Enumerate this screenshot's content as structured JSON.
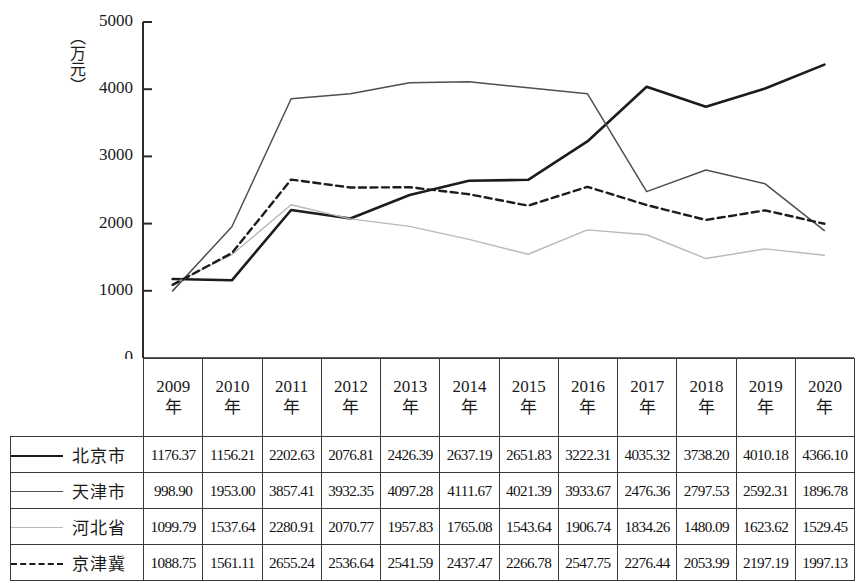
{
  "chart_data": {
    "type": "line",
    "title": "",
    "xlabel": "",
    "ylabel": "（万元）",
    "ylim": [
      0,
      5000
    ],
    "yticks": [
      0,
      1000,
      2000,
      3000,
      4000,
      5000
    ],
    "grid": false,
    "legend_position": "table-left-column",
    "categories": [
      "2009年",
      "2010年",
      "2011年",
      "2012年",
      "2013年",
      "2014年",
      "2015年",
      "2016年",
      "2017年",
      "2018年",
      "2019年",
      "2020年"
    ],
    "series": [
      {
        "name": "北京市",
        "style": "solid-thick-black",
        "color": "#1c1c1c",
        "values": [
          1176.37,
          1156.21,
          2202.63,
          2076.81,
          2426.39,
          2637.19,
          2651.83,
          3222.31,
          4035.32,
          3738.2,
          4010.18,
          4366.1
        ]
      },
      {
        "name": "天津市",
        "style": "solid-medium-gray",
        "color": "#4f4f4f",
        "values": [
          998.9,
          1953.0,
          3857.41,
          3932.35,
          4097.28,
          4111.67,
          4021.39,
          3933.67,
          2476.36,
          2797.53,
          2592.31,
          1896.78
        ]
      },
      {
        "name": "河北省",
        "style": "solid-light-gray",
        "color": "#b9b9b9",
        "values": [
          1099.79,
          1537.64,
          2280.91,
          2070.77,
          1957.83,
          1765.08,
          1543.64,
          1906.74,
          1834.26,
          1480.09,
          1623.62,
          1529.45
        ]
      },
      {
        "name": "京津冀",
        "style": "dashed-black",
        "color": "#1c1c1c",
        "values": [
          1088.75,
          1561.11,
          2655.24,
          2536.64,
          2541.59,
          2437.47,
          2266.78,
          2547.75,
          2276.44,
          2053.99,
          2197.19,
          1997.13
        ]
      }
    ]
  },
  "axis": {
    "y_title": "（万元）",
    "y_tick_labels": [
      "5000",
      "4000",
      "3000",
      "2000",
      "1000",
      "0"
    ]
  },
  "table": {
    "year_headers": [
      {
        "num": "2009",
        "char": "年"
      },
      {
        "num": "2010",
        "char": "年"
      },
      {
        "num": "2011",
        "char": "年"
      },
      {
        "num": "2012",
        "char": "年"
      },
      {
        "num": "2013",
        "char": "年"
      },
      {
        "num": "2014",
        "char": "年"
      },
      {
        "num": "2015",
        "char": "年"
      },
      {
        "num": "2016",
        "char": "年"
      },
      {
        "num": "2017",
        "char": "年"
      },
      {
        "num": "2018",
        "char": "年"
      },
      {
        "num": "2019",
        "char": "年"
      },
      {
        "num": "2020",
        "char": "年"
      }
    ],
    "rows": [
      {
        "label": "北京市",
        "swatch": "solid-thick-black",
        "values": [
          "1176.37",
          "1156.21",
          "2202.63",
          "2076.81",
          "2426.39",
          "2637.19",
          "2651.83",
          "3222.31",
          "4035.32",
          "3738.20",
          "4010.18",
          "4366.10"
        ]
      },
      {
        "label": "天津市",
        "swatch": "solid-medium-gray",
        "values": [
          "998.90",
          "1953.00",
          "3857.41",
          "3932.35",
          "4097.28",
          "4111.67",
          "4021.39",
          "3933.67",
          "2476.36",
          "2797.53",
          "2592.31",
          "1896.78"
        ]
      },
      {
        "label": "河北省",
        "swatch": "solid-light-gray",
        "values": [
          "1099.79",
          "1537.64",
          "2280.91",
          "2070.77",
          "1957.83",
          "1765.08",
          "1543.64",
          "1906.74",
          "1834.26",
          "1480.09",
          "1623.62",
          "1529.45"
        ]
      },
      {
        "label": "京津冀",
        "swatch": "dashed-black",
        "values": [
          "1088.75",
          "1561.11",
          "2655.24",
          "2536.64",
          "2541.59",
          "2437.47",
          "2266.78",
          "2547.75",
          "2276.44",
          "2053.99",
          "2197.19",
          "1997.13"
        ]
      }
    ]
  }
}
